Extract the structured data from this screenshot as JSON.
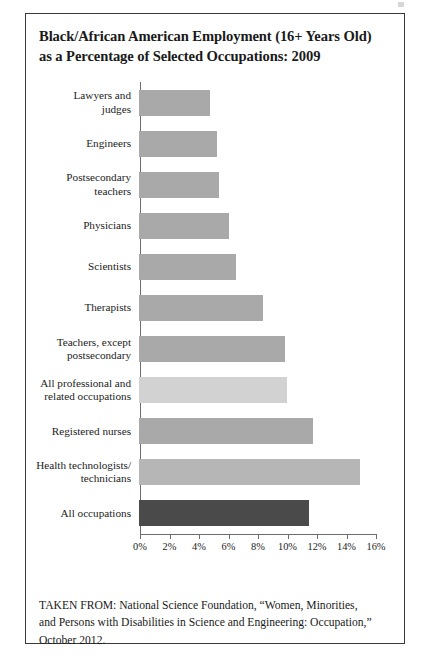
{
  "figure": {
    "title_lines": [
      "Black/African American Employment (16+ Years Old)",
      "as a Percentage of Selected Occupations: 2009"
    ],
    "source_lines": [
      "TAKEN FROM: National Science Foundation, “Women, Minorities,",
      "and Persons with Disabilities in Science and Engineering: Occupation,”",
      "October 2012."
    ]
  },
  "colors": {
    "bar_default": "#a9a9a9",
    "bar_light": "#d2d2d2",
    "bar_mid": "#b6b6b6",
    "bar_dark": "#4a4a4a",
    "axis": "#6d6d6d",
    "border": "#3a3a3a",
    "text": "#1a1a1a"
  },
  "chart_data": {
    "type": "bar",
    "orientation": "horizontal",
    "title": "Black/African American Employment (16+ Years Old) as a Percentage of Selected Occupations: 2009",
    "xlabel": "",
    "ylabel": "",
    "xlim": [
      0,
      16
    ],
    "xtick_labels": [
      "0%",
      "2%",
      "4%",
      "6%",
      "8%",
      "10%",
      "12%",
      "14%",
      "16%"
    ],
    "xticks": [
      0,
      2,
      4,
      6,
      8,
      10,
      12,
      14,
      16
    ],
    "grid": false,
    "legend": false,
    "categories": [
      "Lawyers and judges",
      "Engineers",
      "Postsecondary teachers",
      "Physicians",
      "Scientists",
      "Therapists",
      "Teachers, except postsecondary",
      "All professional and related occupations",
      "Registered nurses",
      "Health technologists/ technicians",
      "All occupations"
    ],
    "values": [
      4.8,
      5.3,
      5.4,
      6.1,
      6.6,
      8.4,
      9.9,
      10.0,
      11.8,
      15.0,
      11.5
    ],
    "bars": [
      {
        "label_lines": [
          "Lawyers and",
          "judges"
        ],
        "value": 4.8,
        "color": "#a9a9a9"
      },
      {
        "label_lines": [
          "Engineers"
        ],
        "value": 5.3,
        "color": "#a9a9a9"
      },
      {
        "label_lines": [
          "Postsecondary",
          "teachers"
        ],
        "value": 5.4,
        "color": "#a9a9a9"
      },
      {
        "label_lines": [
          "Physicians"
        ],
        "value": 6.1,
        "color": "#a9a9a9"
      },
      {
        "label_lines": [
          "Scientists"
        ],
        "value": 6.6,
        "color": "#a9a9a9"
      },
      {
        "label_lines": [
          "Therapists"
        ],
        "value": 8.4,
        "color": "#a9a9a9"
      },
      {
        "label_lines": [
          "Teachers, except",
          "postsecondary"
        ],
        "value": 9.9,
        "color": "#a9a9a9"
      },
      {
        "label_lines": [
          "All professional and",
          "related occupations"
        ],
        "value": 10.0,
        "color": "#d2d2d2"
      },
      {
        "label_lines": [
          "Registered nurses"
        ],
        "value": 11.8,
        "color": "#a9a9a9"
      },
      {
        "label_lines": [
          "Health technologists/",
          "technicians"
        ],
        "value": 15.0,
        "color": "#b6b6b6"
      },
      {
        "label_lines": [
          "All occupations"
        ],
        "value": 11.5,
        "color": "#4a4a4a"
      }
    ]
  }
}
